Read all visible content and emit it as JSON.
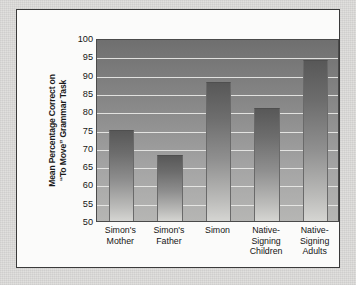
{
  "chart_data": {
    "type": "bar",
    "title": "",
    "xlabel": "",
    "ylabel": "Mean Percentage Correct on \"To Move\" Grammar Task",
    "ylabel_lines": [
      "Mean Percentage Correct on",
      "“To Move” Grammar Task"
    ],
    "categories": [
      "Simon's Mother",
      "Simon's Father",
      "Simon",
      "Native-Signing Children",
      "Native-Signing Adults"
    ],
    "category_lines": [
      [
        "Simon's",
        "Mother"
      ],
      [
        "Simon's",
        "Father"
      ],
      [
        "Simon"
      ],
      [
        "Native-",
        "Signing",
        "Children"
      ],
      [
        "Native-",
        "Signing",
        "Adults"
      ]
    ],
    "values": [
      75,
      68,
      88,
      81,
      94
    ],
    "ylim": [
      50,
      100
    ],
    "ytick_step": 5,
    "yticks": [
      50,
      55,
      60,
      65,
      70,
      75,
      80,
      85,
      90,
      95,
      100
    ],
    "grid": true,
    "legend": "none",
    "colors": {
      "bar_top": "#585858",
      "bar_bottom": "#d5d5d2",
      "plot_bg_top": "#6f6f6f",
      "plot_bg_bottom": "#b6b6b4",
      "gridline": "#e9e9e7",
      "axis": "#4a4a4a",
      "panel_bg": "#fbfbfa",
      "panel_border": "#3a3a3a",
      "page_bg": "#dedddb",
      "text": "#151515"
    }
  }
}
